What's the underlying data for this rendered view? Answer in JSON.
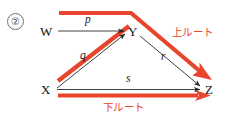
{
  "figure": {
    "item_number": "②",
    "nodes": [
      {
        "id": "W",
        "label": "W",
        "x": 46,
        "y": 33
      },
      {
        "id": "Y",
        "label": "Y",
        "x": 133,
        "y": 33
      },
      {
        "id": "X",
        "label": "X",
        "x": 46,
        "y": 91
      },
      {
        "id": "Z",
        "label": "Z",
        "x": 209,
        "y": 91
      }
    ],
    "edges": [
      {
        "id": "p",
        "label": "p",
        "from": "W",
        "to": "Y",
        "label_x": 88,
        "label_y": 20
      },
      {
        "id": "q",
        "label": "q",
        "from": "X",
        "to": "Y",
        "label_x": 80,
        "label_y": 54
      },
      {
        "id": "r",
        "label": "r",
        "from": "Y",
        "to": "Z",
        "label_x": 160,
        "label_y": 54
      },
      {
        "id": "s",
        "label": "s",
        "from": "X",
        "to": "Z",
        "label_x": 127,
        "label_y": 78
      }
    ],
    "routes": [
      {
        "id": "upper",
        "label": "上ルート",
        "label_x": 172,
        "label_y": 30,
        "color": "#e8452c"
      },
      {
        "id": "lower",
        "label": "下ルート",
        "label_x": 104,
        "label_y": 102,
        "color": "#e8452c"
      }
    ],
    "colors": {
      "route": "#e8452c",
      "edge": "#2a2a2a",
      "text": "#111111"
    }
  }
}
